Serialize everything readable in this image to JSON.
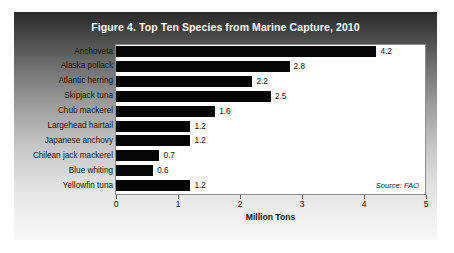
{
  "figure": {
    "title": "Figure 4. Top Ten Species from Marine Capture, 2010",
    "source": "Source: FAO"
  },
  "chart_data": {
    "type": "bar",
    "orientation": "horizontal",
    "title": "Figure 4. Top Ten Species from Marine Capture, 2010",
    "xlabel": "Million Tons",
    "ylabel": "",
    "xlim": [
      0,
      5
    ],
    "xticks": [
      "0",
      "1",
      "2",
      "3",
      "4",
      "5"
    ],
    "grid": false,
    "legend": null,
    "bar_color": "#050505",
    "panel_color": "#ffffff",
    "categories": [
      "Anchoveta",
      "Alaska pollack",
      "Atlantic herring",
      "Skipjack tuna",
      "Chub mackerel",
      "Largehead hairtail",
      "Japanese anchovy",
      "Chilean jack mackerel",
      "Blue whiting",
      "Yellowfin tuna"
    ],
    "values": [
      4.2,
      2.8,
      2.2,
      2.5,
      1.6,
      1.2,
      1.2,
      0.7,
      0.6,
      1.2
    ],
    "value_labels": [
      "4.2",
      "2.8",
      "2.2",
      "2.5",
      "1.6",
      "1.2",
      "1.2",
      "0.7",
      "0.6",
      "1.2"
    ],
    "annotations": [
      "Source: FAO"
    ]
  }
}
